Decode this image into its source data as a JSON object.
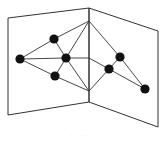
{
  "diagram": {
    "type": "book-embedding-graph",
    "colors": {
      "stroke": "#333333",
      "node": "#111111",
      "background": "#ffffff"
    },
    "pages": [
      {
        "id": "left-page",
        "points": [
          [
            8,
            18
          ],
          [
            89,
            8
          ],
          [
            89,
            102
          ],
          [
            8,
            115
          ]
        ]
      },
      {
        "id": "right-page",
        "points": [
          [
            89,
            8
          ],
          [
            158,
            31
          ],
          [
            158,
            127
          ],
          [
            89,
            102
          ]
        ]
      }
    ],
    "spine": {
      "x": 89,
      "y1": 8,
      "y2": 102
    },
    "spine_vertices": [
      {
        "id": "S1",
        "x": 89,
        "y": 21
      },
      {
        "id": "S2",
        "x": 89,
        "y": 58
      },
      {
        "id": "S3",
        "x": 89,
        "y": 91
      }
    ],
    "nodes": [
      {
        "id": "A",
        "x": 20,
        "y": 59
      },
      {
        "id": "B",
        "x": 54,
        "y": 39
      },
      {
        "id": "C",
        "x": 66,
        "y": 58
      },
      {
        "id": "D",
        "x": 55,
        "y": 76
      },
      {
        "id": "E",
        "x": 120,
        "y": 57
      },
      {
        "id": "F",
        "x": 109,
        "y": 69
      },
      {
        "id": "G",
        "x": 145,
        "y": 89
      }
    ],
    "edges": [
      [
        "A",
        "B"
      ],
      [
        "A",
        "C"
      ],
      [
        "A",
        "D"
      ],
      [
        "B",
        "C"
      ],
      [
        "D",
        "C"
      ],
      [
        "B",
        "S1"
      ],
      [
        "C",
        "S1"
      ],
      [
        "C",
        "S2"
      ],
      [
        "C",
        "S3"
      ],
      [
        "D",
        "S3"
      ],
      [
        "S1",
        "E"
      ],
      [
        "S2",
        "F"
      ],
      [
        "E",
        "F"
      ],
      [
        "E",
        "G"
      ],
      [
        "F",
        "G"
      ],
      [
        "F",
        "S3"
      ]
    ],
    "caption": "· · · · ·"
  }
}
